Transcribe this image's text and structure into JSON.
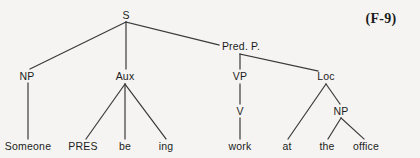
{
  "figure": {
    "label": "(F-9)",
    "label_x": 381,
    "label_y": 19,
    "background_color": "#f5f4f2",
    "line_color": "#3a3a3a",
    "text_color": "#1c1c1c"
  },
  "tree": {
    "type": "syntax-tree",
    "sentence": "Someone PRES be ing work at the office",
    "nodes": [
      {
        "id": "s",
        "label": "S",
        "x": 126,
        "y": 15,
        "kind": "category",
        "role": "root"
      },
      {
        "id": "np1",
        "label": "NP",
        "x": 27,
        "y": 76,
        "kind": "category",
        "role": "subject"
      },
      {
        "id": "aux",
        "label": "Aux",
        "x": 125,
        "y": 76,
        "kind": "category",
        "role": "auxiliary"
      },
      {
        "id": "predp",
        "label": "Pred. P.",
        "x": 241,
        "y": 46,
        "kind": "category",
        "role": "predicate-phrase"
      },
      {
        "id": "vp",
        "label": "VP",
        "x": 240,
        "y": 76,
        "kind": "category",
        "role": "verb-phrase"
      },
      {
        "id": "loc",
        "label": "Loc",
        "x": 326,
        "y": 76,
        "kind": "category",
        "role": "locative"
      },
      {
        "id": "v",
        "label": "V",
        "x": 240,
        "y": 111,
        "kind": "category",
        "role": "verb"
      },
      {
        "id": "np2",
        "label": "NP",
        "x": 341,
        "y": 111,
        "kind": "category",
        "role": "object-of-preposition"
      },
      {
        "id": "someone",
        "label": "Someone",
        "x": 28,
        "y": 146,
        "kind": "leaf",
        "role": "terminal"
      },
      {
        "id": "pres",
        "label": "PRES",
        "x": 83,
        "y": 146,
        "kind": "leaf",
        "role": "terminal"
      },
      {
        "id": "be",
        "label": "be",
        "x": 125,
        "y": 146,
        "kind": "leaf",
        "role": "terminal"
      },
      {
        "id": "ing",
        "label": "ing",
        "x": 166,
        "y": 146,
        "kind": "leaf",
        "role": "terminal"
      },
      {
        "id": "work",
        "label": "work",
        "x": 240,
        "y": 146,
        "kind": "leaf",
        "role": "terminal"
      },
      {
        "id": "at",
        "label": "at",
        "x": 287,
        "y": 146,
        "kind": "leaf",
        "role": "terminal"
      },
      {
        "id": "the",
        "label": "the",
        "x": 327,
        "y": 146,
        "kind": "leaf",
        "role": "terminal"
      },
      {
        "id": "office",
        "label": "office",
        "x": 366,
        "y": 146,
        "kind": "leaf",
        "role": "terminal"
      }
    ],
    "edges": [
      {
        "from": "s",
        "to": "np1",
        "x1": 126,
        "y1": 22,
        "x2": 30,
        "y2": 69
      },
      {
        "from": "s",
        "to": "aux",
        "x1": 126,
        "y1": 22,
        "x2": 126,
        "y2": 69
      },
      {
        "from": "s",
        "to": "predp",
        "x1": 126,
        "y1": 22,
        "x2": 219,
        "y2": 45
      },
      {
        "from": "predp",
        "to": "vp",
        "x1": 240,
        "y1": 54,
        "x2": 240,
        "y2": 69
      },
      {
        "from": "predp",
        "to": "loc",
        "x1": 240,
        "y1": 54,
        "x2": 318,
        "y2": 71
      },
      {
        "from": "np1",
        "to": "someone",
        "x1": 28,
        "y1": 83,
        "x2": 28,
        "y2": 139
      },
      {
        "from": "aux",
        "to": "pres",
        "x1": 125,
        "y1": 84,
        "x2": 86,
        "y2": 139
      },
      {
        "from": "aux",
        "to": "be",
        "x1": 125,
        "y1": 84,
        "x2": 125,
        "y2": 139
      },
      {
        "from": "aux",
        "to": "ing",
        "x1": 125,
        "y1": 84,
        "x2": 166,
        "y2": 139
      },
      {
        "from": "vp",
        "to": "v",
        "x1": 240,
        "y1": 84,
        "x2": 240,
        "y2": 104
      },
      {
        "from": "v",
        "to": "work",
        "x1": 240,
        "y1": 118,
        "x2": 240,
        "y2": 139
      },
      {
        "from": "loc",
        "to": "at",
        "x1": 326,
        "y1": 84,
        "x2": 288,
        "y2": 139
      },
      {
        "from": "loc",
        "to": "np2",
        "x1": 326,
        "y1": 84,
        "x2": 340,
        "y2": 104
      },
      {
        "from": "np2",
        "to": "the",
        "x1": 341,
        "y1": 118,
        "x2": 328,
        "y2": 139
      },
      {
        "from": "np2",
        "to": "office",
        "x1": 341,
        "y1": 118,
        "x2": 364,
        "y2": 139
      }
    ]
  }
}
